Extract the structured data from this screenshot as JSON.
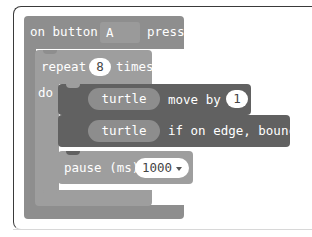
{
  "event_block": {
    "prefix": "on button",
    "button_value": "A",
    "suffix": "pressed",
    "color": "#8e8e8e"
  },
  "repeat_block": {
    "label": "repeat",
    "count": "8",
    "suffix": "times",
    "do_label": "do",
    "color": "#9e9e9e"
  },
  "statements": [
    {
      "sprite": "turtle",
      "action": "move by",
      "value": "1",
      "color": "#616161"
    },
    {
      "sprite": "turtle",
      "action": "if on edge, bounce",
      "color": "#616161"
    }
  ],
  "pause_block": {
    "label": "pause (ms)",
    "value": "1000",
    "dropdown_icon": "caret-down-icon",
    "color": "#9e9e9e"
  }
}
